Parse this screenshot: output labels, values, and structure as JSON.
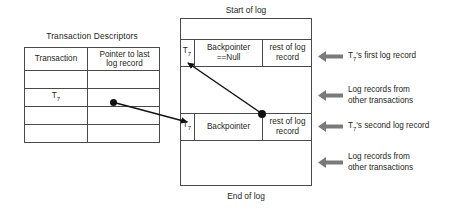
{
  "descriptors": {
    "title": "Transaction Descriptors",
    "columns": [
      "Transaction",
      "Pointer to last\nlog record"
    ],
    "rows": [
      {
        "transaction": "",
        "pointer": ""
      },
      {
        "transaction": "T7",
        "pointer": "dot"
      },
      {
        "transaction": "",
        "pointer": ""
      },
      {
        "transaction": "",
        "pointer": ""
      }
    ],
    "highlight_row_index": 1,
    "highlight_transaction_base": "T",
    "highlight_transaction_sub": "7"
  },
  "log": {
    "start_label": "Start of log",
    "end_label": "End of log",
    "records": [
      {
        "transaction_base": "T",
        "transaction_sub": "7",
        "backpointer": "Backpointer\n==Null",
        "rest": "rest of log\nrecord"
      },
      {
        "transaction_base": "T",
        "transaction_sub": "7",
        "backpointer": "Backpointer",
        "rest": "rest of log\nrecord"
      }
    ]
  },
  "annotations": [
    {
      "id": "first-log-record",
      "text": "T7's first log record"
    },
    {
      "id": "other-transactions-upper",
      "text": "Log records from\nother transactions"
    },
    {
      "id": "second-log-record",
      "text": "T7's second log record"
    },
    {
      "id": "other-transactions-lower",
      "text": "Log records from\nother transactions"
    }
  ],
  "annotation_parts": [
    {
      "base": "T",
      "sub": "7",
      "tail": "'s first log record"
    },
    {
      "base": "",
      "sub": "",
      "tail": "Log records from\nother transactions"
    },
    {
      "base": "T",
      "sub": "7",
      "tail": "'s second log record"
    },
    {
      "base": "",
      "sub": "",
      "tail": "Log records from\nother transactions"
    }
  ],
  "colors": {
    "stroke": "#4a4a4a",
    "text": "#231f20",
    "pointer": "#111111",
    "callout_arrow": "#7a7a7a",
    "background": "#ffffff"
  }
}
